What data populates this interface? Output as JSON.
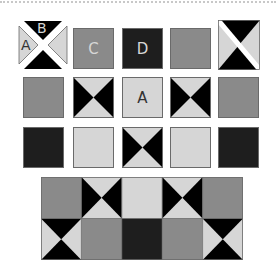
{
  "colors": {
    "mid_gray": "#8a8a8a",
    "light_gray": "#d6d6d6",
    "dark": "#1e1e1e",
    "black": "#000000",
    "border": "#6a6a6a"
  },
  "row1": {
    "piece_labels": {
      "top": "B",
      "left": "A"
    },
    "square_c_label": "C",
    "square_d_label": "D"
  },
  "row2": {
    "center_label": "A",
    "cells": [
      "mid",
      "hourglass",
      "light",
      "hourglass",
      "mid"
    ]
  },
  "row3": {
    "cells": [
      "dark",
      "light",
      "hourglass",
      "light",
      "dark"
    ]
  },
  "quilt": {
    "top_row": [
      "mid",
      "hourglass",
      "light",
      "hourglass",
      "mid"
    ],
    "bottom_row": [
      "hourglass-side",
      "mid",
      "dark",
      "mid",
      "hourglass-side"
    ]
  }
}
